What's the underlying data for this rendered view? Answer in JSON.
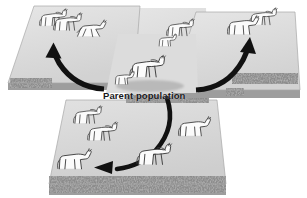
{
  "figure": {
    "type": "biology-diagram",
    "caption_label": "Parent population",
    "background_color": "#ffffff",
    "plateau_fill": "#d8d8d8",
    "plateau_fill_light": "#e2e2e2",
    "plateau_edge_color": "#9a9a9a",
    "rock_band_color": "#8e8e8e",
    "arrow_color": "#111111",
    "animal_outline_color": "#3a3a3a",
    "animal_fill_color": "#fbfbfb"
  },
  "labels": [
    {
      "id": "parent-population",
      "text": "Parent population",
      "x": 103,
      "y": 90
    }
  ],
  "plateaus": [
    {
      "id": "upper-left-plateau",
      "name": "isolated habitat upper left",
      "animal_count": 3
    },
    {
      "id": "central-plateau",
      "name": "parent population habitat",
      "animal_count": 2
    },
    {
      "id": "upper-right-plateau",
      "name": "isolated habitat upper right",
      "animal_count": 2
    },
    {
      "id": "upper-middle-plateau",
      "name": "isolated habitat upper middle",
      "animal_count": 2
    },
    {
      "id": "lower-plateau",
      "name": "isolated habitat lower",
      "animal_count": 4
    }
  ],
  "arrows": [
    {
      "id": "arrow-to-upper-left",
      "from": "central-plateau",
      "to": "upper-left-plateau",
      "direction": "up-left"
    },
    {
      "id": "arrow-to-upper-right",
      "from": "central-plateau",
      "to": "upper-right-plateau",
      "direction": "up-right"
    },
    {
      "id": "arrow-to-lower",
      "from": "central-plateau",
      "to": "lower-plateau",
      "direction": "down-then-left"
    }
  ],
  "animals": [
    {
      "id": "horse-ul-1",
      "group": "upper-left-plateau",
      "pose": "standing"
    },
    {
      "id": "horse-ul-2",
      "group": "upper-left-plateau",
      "pose": "standing"
    },
    {
      "id": "horse-ul-3",
      "group": "upper-left-plateau",
      "pose": "galloping"
    },
    {
      "id": "horse-um-1",
      "group": "upper-middle-plateau",
      "pose": "standing-adult"
    },
    {
      "id": "horse-um-2",
      "group": "upper-middle-plateau",
      "pose": "standing-foal"
    },
    {
      "id": "horse-ur-1",
      "group": "upper-right-plateau",
      "pose": "standing"
    },
    {
      "id": "horse-ur-2",
      "group": "upper-right-plateau",
      "pose": "standing"
    },
    {
      "id": "horse-c-1",
      "group": "central-plateau",
      "pose": "standing-adult"
    },
    {
      "id": "horse-c-2",
      "group": "central-plateau",
      "pose": "standing-foal"
    },
    {
      "id": "horse-ll-1",
      "group": "lower-plateau",
      "pose": "standing"
    },
    {
      "id": "horse-ll-2",
      "group": "lower-plateau",
      "pose": "standing"
    },
    {
      "id": "horse-ll-3",
      "group": "lower-plateau",
      "pose": "standing-stocky"
    },
    {
      "id": "horse-lc-1",
      "group": "lower-plateau",
      "pose": "standing"
    },
    {
      "id": "horse-lr-1",
      "group": "lower-plateau",
      "pose": "standing"
    }
  ]
}
